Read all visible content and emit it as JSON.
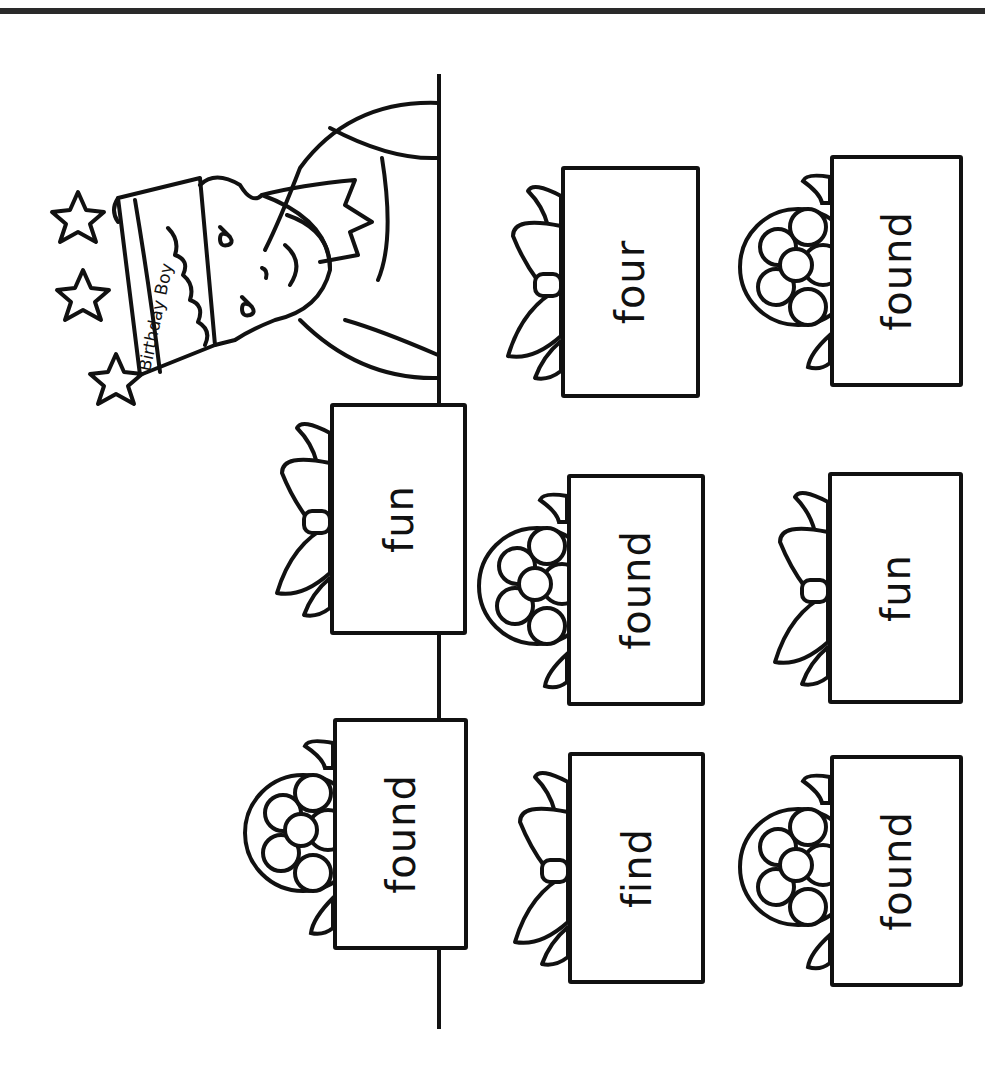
{
  "worksheet": {
    "orientation": "rotated-90-ccw",
    "crown_label": "Birthday Boy",
    "line_color": "#111111",
    "background": "#ffffff"
  },
  "gifts": [
    {
      "word": "fun",
      "bow": "ribbon-bow",
      "row": "top",
      "position": 1
    },
    {
      "word": "found",
      "bow": "flower-bow",
      "row": "top",
      "position": 2
    },
    {
      "word": "four",
      "bow": "ribbon-bow",
      "row": "middle",
      "position": 0
    },
    {
      "word": "found",
      "bow": "flower-bow",
      "row": "middle",
      "position": 1
    },
    {
      "word": "find",
      "bow": "ribbon-bow",
      "row": "middle",
      "position": 2
    },
    {
      "word": "found",
      "bow": "flower-bow",
      "row": "bottom",
      "position": 0
    },
    {
      "word": "fun",
      "bow": "ribbon-bow",
      "row": "bottom",
      "position": 1
    },
    {
      "word": "found",
      "bow": "flower-bow",
      "row": "bottom",
      "position": 2
    }
  ]
}
